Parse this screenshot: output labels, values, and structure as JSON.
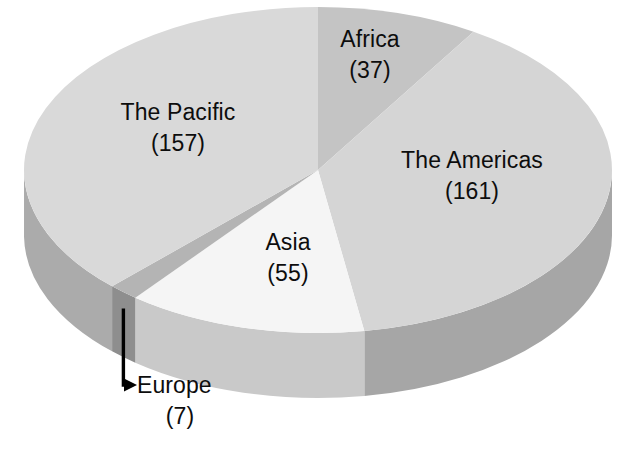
{
  "chart_data": {
    "type": "pie",
    "title": "",
    "subtitle": "",
    "xlabel": "",
    "ylabel": "",
    "grid": false,
    "legend_position": "none",
    "label_format": "name on first line, count in parentheses on second line",
    "three_d": true,
    "total": 417,
    "categories": [
      "Africa",
      "The Americas",
      "Asia",
      "Europe",
      "The Pacific"
    ],
    "values": [
      37,
      161,
      55,
      7,
      157
    ],
    "slices": [
      {
        "name": "Africa",
        "value": 37,
        "value_label": "(37)",
        "percent": 8.9,
        "top_color": "#c4c4c4",
        "side_color": "#9a9a9a"
      },
      {
        "name": "The Americas",
        "value": 161,
        "value_label": "(161)",
        "percent": 38.6,
        "top_color": "#d5d5d5",
        "side_color": "#a6a6a6"
      },
      {
        "name": "Asia",
        "value": 55,
        "value_label": "(55)",
        "percent": 13.2,
        "top_color": "#f5f5f5",
        "side_color": "#c9c9c9"
      },
      {
        "name": "Europe",
        "value": 7,
        "value_label": "(7)",
        "percent": 1.7,
        "top_color": "#b4b4b4",
        "side_color": "#8e8e8e"
      },
      {
        "name": "The Pacific",
        "value": 157,
        "value_label": "(157)",
        "percent": 37.6,
        "top_color": "#d9d9d9",
        "side_color": "#ababab"
      }
    ],
    "annotations": [
      {
        "name": "europe-callout",
        "text": "Europe",
        "value_label": "(7)",
        "style": "elbow leader line with arrowhead pointing right",
        "color": "#000000"
      }
    ]
  },
  "geometry": {
    "cx": 318,
    "cy": 170,
    "rx": 294,
    "ry": 163,
    "depth": 65,
    "start_angle_deg": -90,
    "direction": "clockwise"
  },
  "labels": {
    "africa": {
      "name": "Africa",
      "value": "(37)"
    },
    "americas": {
      "name": "The Americas",
      "value": "(161)"
    },
    "asia": {
      "name": "Asia",
      "value": "(55)"
    },
    "europe": {
      "name": "Europe",
      "value": "(7)"
    },
    "pacific": {
      "name": "The Pacific",
      "value": "(157)"
    }
  },
  "colors": {
    "background": "#ffffff",
    "text": "#0d0d0d",
    "leader_line": "#000000"
  }
}
